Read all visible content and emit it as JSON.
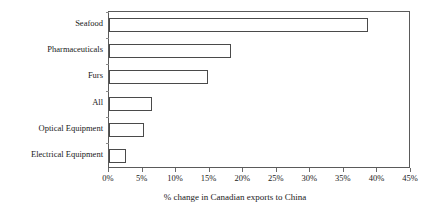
{
  "chart_data": {
    "type": "bar",
    "orientation": "horizontal",
    "title": "",
    "xlabel": "% change in Canadian exports to China",
    "ylabel": "",
    "categories": [
      "Seafood",
      "Pharmaceuticals",
      "Furs",
      "All",
      "Optical Equipment",
      "Electrical Equipment"
    ],
    "values": [
      38.6,
      18.2,
      14.7,
      6.4,
      5.2,
      2.5
    ],
    "xlim": [
      0,
      45
    ],
    "ylim": null,
    "xticks": [
      0,
      5,
      10,
      15,
      20,
      25,
      30,
      35,
      40,
      45
    ],
    "xtick_labels": [
      "0%",
      "5%",
      "10%",
      "15%",
      "20%",
      "25%",
      "30%",
      "35%",
      "40%",
      "45%"
    ],
    "grid": false,
    "legend": null,
    "series": [
      {
        "name": "% change in Canadian exports to China",
        "values": [
          38.6,
          18.2,
          14.7,
          6.4,
          5.2,
          2.5
        ]
      }
    ],
    "style": {
      "bar_fill": "#ffffff",
      "bar_border": "#4a4a4a",
      "axis_color": "#5a5a5a",
      "text_color": "#1a1a1a",
      "background": "#ffffff"
    }
  }
}
